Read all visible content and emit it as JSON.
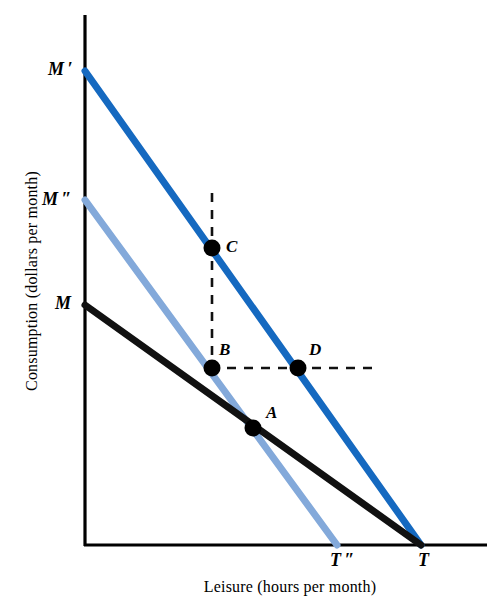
{
  "figure": {
    "width": 487,
    "height": 597,
    "background": "#ffffff",
    "type": "economics-budget-constraint-diagram"
  },
  "axes": {
    "y_title": "Consumption (dollars per month)",
    "x_title": "Leisure (hours per month)",
    "axis_color": "#000000",
    "origin_px": {
      "x": 85,
      "y": 545
    },
    "y_axis_top_px": 15,
    "x_axis_right_px": 487
  },
  "colors": {
    "budget_line_dark_blue": "#1569c0",
    "budget_line_light_blue": "#83a9da",
    "budget_line_black": "#111111",
    "dashed_guide": "#111111",
    "point_marker": "#000000",
    "text": "#000000"
  },
  "intercept_labels": [
    {
      "id": "M-prime",
      "text": "M ′",
      "x": 48,
      "y": 60,
      "axis": "y",
      "belongs_to": "line-M-prime"
    },
    {
      "id": "M-double-prime",
      "text": "M ″",
      "x": 42,
      "y": 190,
      "axis": "y",
      "belongs_to": "line-M-double-prime"
    },
    {
      "id": "M",
      "text": "M",
      "x": 55,
      "y": 294,
      "axis": "y",
      "belongs_to": "line-M"
    },
    {
      "id": "T-double-prime",
      "text": "T ″",
      "x": 330,
      "y": 551,
      "axis": "x",
      "belongs_to": "line-M-double-prime"
    },
    {
      "id": "T",
      "text": "T",
      "x": 418,
      "y": 551,
      "axis": "x",
      "belongs_to": "line-M-and-M-prime"
    }
  ],
  "lines": [
    {
      "id": "line-M-prime",
      "label": "M ′ T",
      "color": "#1569c0",
      "width": 7,
      "start": {
        "x": 85,
        "y": 71
      },
      "end": {
        "x": 421,
        "y": 545
      },
      "description": "New budget constraint with higher nonlabor income, same wage"
    },
    {
      "id": "line-M-double-prime",
      "label": "M ″ T ″",
      "color": "#83a9da",
      "width": 7,
      "start": {
        "x": 85,
        "y": 200
      },
      "end": {
        "x": 337,
        "y": 545
      },
      "description": "Compensated budget constraint, steeper slope"
    },
    {
      "id": "line-M",
      "label": "M T",
      "color": "#111111",
      "width": 7,
      "start": {
        "x": 85,
        "y": 305
      },
      "end": {
        "x": 421,
        "y": 545
      },
      "description": "Original budget constraint"
    }
  ],
  "dashed_guides": [
    {
      "id": "vertical-guide-C-B",
      "orientation": "vertical",
      "x": 212,
      "y1": 193,
      "y2": 370,
      "dash": "9 8"
    },
    {
      "id": "horizontal-guide-B-D",
      "orientation": "horizontal",
      "y": 368,
      "x1": 210,
      "x2": 378,
      "dash": "9 8"
    }
  ],
  "points": [
    {
      "id": "C",
      "label": "C",
      "x": 212,
      "y": 248,
      "r": 8.5,
      "label_x": 226,
      "label_y": 238,
      "on_line": "line-M-prime"
    },
    {
      "id": "B",
      "label": "B",
      "x": 212,
      "y": 368,
      "r": 8.5,
      "label_x": 219,
      "label_y": 341,
      "on_line": "line-M-double-prime"
    },
    {
      "id": "D",
      "label": "D",
      "x": 298,
      "y": 368,
      "r": 8.5,
      "label_x": 309,
      "label_y": 341,
      "on_line": "line-M-prime"
    },
    {
      "id": "A",
      "label": "A",
      "x": 253,
      "y": 428,
      "r": 8.5,
      "label_x": 266,
      "label_y": 404,
      "on_line": "line-M"
    }
  ],
  "chart_data": {
    "type": "line",
    "title": "",
    "xlabel": "Leisure (hours per month)",
    "ylabel": "Consumption (dollars per month)",
    "grid": false,
    "legend": "none",
    "axis_ticks": {
      "x": [
        "T ″",
        "T"
      ],
      "y": [
        "M",
        "M ″",
        "M ′"
      ]
    },
    "series": [
      {
        "name": "M ′ T",
        "color": "#1569c0",
        "x": [
          0,
          100
        ],
        "y": [
          89.4,
          0
        ],
        "style": "solid"
      },
      {
        "name": "M ″ T ″",
        "color": "#83a9da",
        "x": [
          0,
          75.2
        ],
        "y": [
          65.1,
          0
        ],
        "style": "solid"
      },
      {
        "name": "M T",
        "color": "#111111",
        "x": [
          0,
          100
        ],
        "y": [
          45.3,
          0
        ],
        "style": "solid"
      }
    ],
    "annotations": [
      {
        "label": "C",
        "x": 37.9,
        "y": 56.0,
        "series": "M ′ T"
      },
      {
        "label": "B",
        "x": 37.9,
        "y": 33.4,
        "series": "M ″ T ″"
      },
      {
        "label": "D",
        "x": 63.4,
        "y": 33.4,
        "series": "M ′ T"
      },
      {
        "label": "A",
        "x": 50.0,
        "y": 22.1,
        "series": "M T"
      }
    ]
  }
}
